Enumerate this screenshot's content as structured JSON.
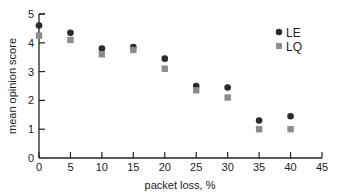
{
  "chart_data": {
    "type": "scatter",
    "title": "",
    "xlabel": "packet loss, %",
    "ylabel": "mean opinion score",
    "xlim": [
      0,
      45
    ],
    "ylim": [
      0,
      5
    ],
    "xticks": [
      0,
      5,
      10,
      15,
      20,
      25,
      30,
      35,
      40,
      45
    ],
    "yticks": [
      0,
      1,
      2,
      3,
      4,
      5
    ],
    "grid": false,
    "legend_position": "upper right",
    "x": [
      0,
      5,
      10,
      15,
      20,
      25,
      30,
      35,
      40
    ],
    "series": [
      {
        "name": "LE",
        "marker": "circle",
        "color": "#2a2a2a",
        "values": [
          4.6,
          4.35,
          3.8,
          3.85,
          3.45,
          2.5,
          2.45,
          1.3,
          1.45
        ]
      },
      {
        "name": "LQ",
        "marker": "square",
        "color": "#8c8c8c",
        "values": [
          4.25,
          4.1,
          3.6,
          3.75,
          3.1,
          2.35,
          2.1,
          1.0,
          1.0
        ]
      }
    ]
  }
}
